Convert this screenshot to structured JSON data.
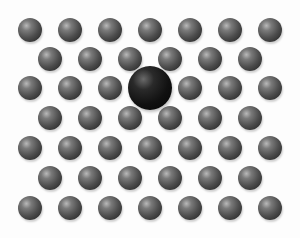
{
  "image": {
    "description": "Hexagonal lattice of gray spheres with one larger dark substitutional/interstitial atom",
    "width": 300,
    "height": 238
  },
  "lattice": {
    "rows": [
      {
        "y": 30,
        "x": [
          30,
          70,
          110,
          150,
          190,
          230,
          270
        ]
      },
      {
        "y": 59,
        "x": [
          50,
          90,
          130,
          170,
          210,
          250
        ]
      },
      {
        "y": 88,
        "x": [
          30,
          70,
          110,
          190,
          230,
          270
        ]
      },
      {
        "y": 118,
        "x": [
          50,
          90,
          130,
          170,
          210,
          250
        ]
      },
      {
        "y": 148,
        "x": [
          30,
          70,
          110,
          150,
          190,
          230,
          270
        ]
      },
      {
        "y": 178,
        "x": [
          50,
          90,
          130,
          170,
          210,
          250
        ]
      },
      {
        "y": 208,
        "x": [
          30,
          70,
          110,
          150,
          190,
          230,
          270
        ]
      }
    ],
    "small_radius": 12,
    "small_color": "#4d4d4d"
  },
  "defect": {
    "x": 150,
    "y": 88,
    "radius": 22,
    "color": "#111111"
  }
}
